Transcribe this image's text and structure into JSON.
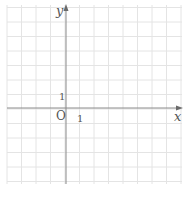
{
  "diagram": {
    "type": "coordinate-plane",
    "grid": {
      "color": "#e4e4e4",
      "spacing_px": 14.5,
      "left": 7,
      "top": 5,
      "right": 182,
      "bottom": 184,
      "columns": 12,
      "rows": 12
    },
    "axes": {
      "color": "#8a8a8a",
      "origin_px": {
        "x": 66,
        "y": 108
      },
      "x_axis": {
        "label": "x",
        "arrow": true
      },
      "y_axis": {
        "label": "y",
        "arrow": true
      }
    },
    "labels": {
      "origin": "O",
      "x_unit": "1",
      "y_unit": "1"
    }
  }
}
